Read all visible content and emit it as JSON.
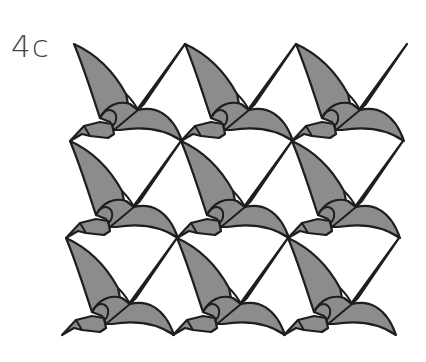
{
  "figure": {
    "label": "4c",
    "rows": 3,
    "columns": 3,
    "colors": {
      "fill": "#8c8c8c",
      "stroke": "#1e1e1e",
      "background": "#ffffff",
      "label": "#444444"
    }
  }
}
